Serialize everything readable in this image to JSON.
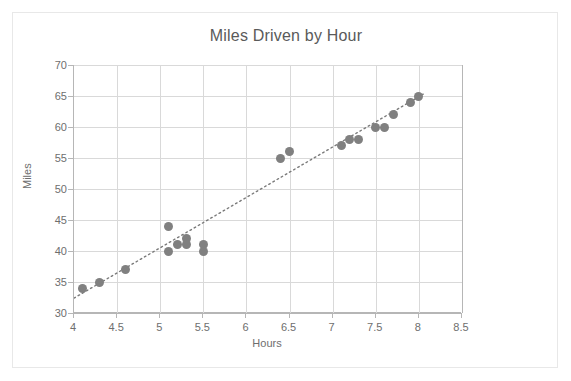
{
  "chart_data": {
    "type": "scatter",
    "title": "Miles Driven by Hour",
    "xlabel": "Hours",
    "ylabel": "Miles",
    "xlim": [
      4,
      8.5
    ],
    "ylim": [
      30,
      70
    ],
    "xticks": [
      "4",
      "4.5",
      "5",
      "5.5",
      "6",
      "6.5",
      "7",
      "7.5",
      "8",
      "8.5"
    ],
    "xtick_values": [
      4,
      4.5,
      5,
      5.5,
      6,
      6.5,
      7,
      7.5,
      8,
      8.5
    ],
    "yticks": [
      "30",
      "35",
      "40",
      "45",
      "50",
      "55",
      "60",
      "65",
      "70"
    ],
    "ytick_values": [
      30,
      35,
      40,
      45,
      50,
      55,
      60,
      65,
      70
    ],
    "grid": true,
    "legend": false,
    "marker_color": "#808080",
    "trendline": {
      "style": "dotted",
      "color": "#7a7a7a",
      "x_start": 4.0,
      "y_start": 32.4,
      "x_end": 8.05,
      "y_end": 65.3
    },
    "series": [
      {
        "name": "Miles Driven by Hour",
        "points": [
          {
            "x": 4.1,
            "y": 34
          },
          {
            "x": 4.3,
            "y": 35
          },
          {
            "x": 4.6,
            "y": 37
          },
          {
            "x": 5.1,
            "y": 44
          },
          {
            "x": 5.1,
            "y": 40
          },
          {
            "x": 5.2,
            "y": 41
          },
          {
            "x": 5.3,
            "y": 42
          },
          {
            "x": 5.3,
            "y": 41
          },
          {
            "x": 5.5,
            "y": 41
          },
          {
            "x": 5.5,
            "y": 40
          },
          {
            "x": 6.4,
            "y": 55
          },
          {
            "x": 6.5,
            "y": 56
          },
          {
            "x": 7.1,
            "y": 57
          },
          {
            "x": 7.2,
            "y": 58
          },
          {
            "x": 7.3,
            "y": 58
          },
          {
            "x": 7.5,
            "y": 60
          },
          {
            "x": 7.6,
            "y": 60
          },
          {
            "x": 7.7,
            "y": 62
          },
          {
            "x": 7.9,
            "y": 64
          },
          {
            "x": 8.0,
            "y": 65
          }
        ]
      }
    ]
  }
}
